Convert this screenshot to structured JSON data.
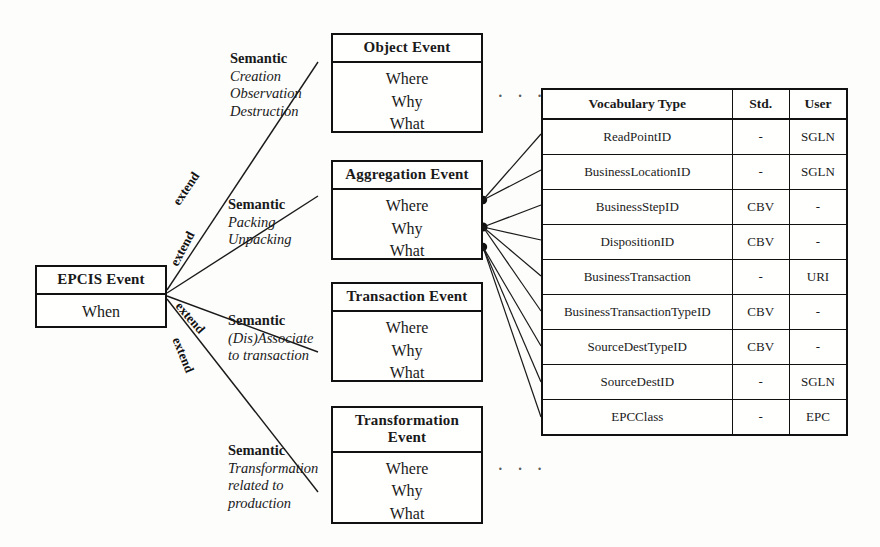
{
  "root_event": {
    "title": "EPCIS Event",
    "body": [
      "When"
    ]
  },
  "relationship_label": "extend",
  "relationships": [
    {
      "label": "extend"
    },
    {
      "label": "extend"
    },
    {
      "label": "extend"
    },
    {
      "label": "extend"
    }
  ],
  "events": [
    {
      "key": "object",
      "title": "Object Event",
      "title_lines": [
        "Object Event"
      ],
      "body": [
        "Where",
        "Why",
        "What"
      ],
      "semantic": {
        "heading": "Semantic",
        "items": [
          "Creation",
          "Observation",
          "Destruction"
        ]
      }
    },
    {
      "key": "aggregation",
      "title": "Aggregation Event",
      "title_lines": [
        "Aggregation Event"
      ],
      "body": [
        "Where",
        "Why",
        "What"
      ],
      "semantic": {
        "heading": "Semantic",
        "items": [
          "Packing",
          "Unpacking"
        ]
      }
    },
    {
      "key": "transaction",
      "title": "Transaction Event",
      "title_lines": [
        "Transaction Event"
      ],
      "body": [
        "Where",
        "Why",
        "What"
      ],
      "semantic": {
        "heading": "Semantic",
        "items": [
          "(Dis)Associate",
          "to transaction"
        ]
      }
    },
    {
      "key": "transformation",
      "title": "Transformation Event",
      "title_lines": [
        "Transformation",
        "Event"
      ],
      "body": [
        "Where",
        "Why",
        "What"
      ],
      "semantic": {
        "heading": "Semantic",
        "items": [
          "Transformation",
          "related to",
          "production"
        ]
      }
    }
  ],
  "ellipsis": {
    "top": "· · ·",
    "bottom": "· · ·"
  },
  "vocabulary_table": {
    "headers": [
      "Vocabulary Type",
      "Std.",
      "User"
    ],
    "rows": [
      {
        "type": "ReadPointID",
        "std": "-",
        "user": "SGLN"
      },
      {
        "type": "BusinessLocationID",
        "std": "-",
        "user": "SGLN"
      },
      {
        "type": "BusinessStepID",
        "std": "CBV",
        "user": "-"
      },
      {
        "type": "DispositionID",
        "std": "CBV",
        "user": "-"
      },
      {
        "type": "BusinessTransaction",
        "std": "-",
        "user": "URI"
      },
      {
        "type": "BusinessTransactionTypeID",
        "std": "CBV",
        "user": "-"
      },
      {
        "type": "SourceDestTypeID",
        "std": "CBV",
        "user": "-"
      },
      {
        "type": "SourceDestID",
        "std": "-",
        "user": "SGLN"
      },
      {
        "type": "EPCClass",
        "std": "-",
        "user": "EPC"
      }
    ]
  },
  "colors": {
    "stroke": "#1a1a1a",
    "background": "#fdfdfc",
    "box_fill": "#fffffe"
  }
}
